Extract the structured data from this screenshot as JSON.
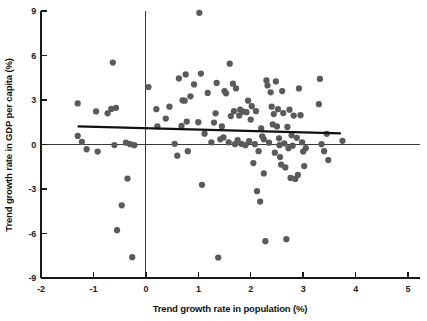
{
  "chart_data": {
    "type": "scatter",
    "title": "",
    "xlabel": "Trend growth rate in population (%)",
    "ylabel": "Trend growth rate in GDP per capita (%)",
    "xlim": [
      -2,
      5.3
    ],
    "ylim": [
      -9,
      9
    ],
    "xticks": [
      -2,
      -1,
      0,
      1,
      2,
      3,
      4,
      5
    ],
    "xtick_labels": [
      "-2",
      "-1",
      "0",
      "1",
      "2",
      "3",
      "4",
      "5"
    ],
    "yticks": [
      -9,
      -6,
      -3,
      0,
      3,
      6,
      9
    ],
    "ytick_labels": [
      "-9",
      "-6",
      "-3",
      "0",
      "3",
      "6",
      "9"
    ],
    "grid": false,
    "legend": "none",
    "marker": {
      "shape": "circle",
      "color": "#5a5a5a",
      "size": 4.0
    },
    "reference_lines": [
      {
        "name": "horizontal-zero-line",
        "orientation": "horizontal",
        "value": 0,
        "color": "#3a3a3a"
      },
      {
        "name": "vertical-zero-line",
        "orientation": "vertical",
        "value": 0,
        "color": "#3a3a3a"
      }
    ],
    "fit_line": {
      "name": "regression-line",
      "x_start": -1.3,
      "y_start": 1.22,
      "x_end": 3.72,
      "y_end": 0.75,
      "color": "#111111"
    },
    "points": [
      [
        -1.3,
        2.77
      ],
      [
        -1.3,
        0.58
      ],
      [
        -1.22,
        0.18
      ],
      [
        -1.13,
        -0.32
      ],
      [
        -0.95,
        2.23
      ],
      [
        -0.92,
        -0.48
      ],
      [
        -0.73,
        2.1
      ],
      [
        -0.66,
        2.4
      ],
      [
        -0.63,
        5.52
      ],
      [
        -0.6,
        -0.04
      ],
      [
        -0.57,
        2.47
      ],
      [
        -0.55,
        -5.78
      ],
      [
        -0.46,
        -4.1
      ],
      [
        -0.38,
        0.12
      ],
      [
        -0.35,
        -2.3
      ],
      [
        -0.3,
        0.02
      ],
      [
        -0.26,
        -7.6
      ],
      [
        -0.22,
        -0.05
      ],
      [
        0.05,
        3.87
      ],
      [
        0.2,
        2.38
      ],
      [
        0.22,
        1.22
      ],
      [
        0.38,
        1.75
      ],
      [
        0.45,
        2.55
      ],
      [
        0.6,
        -0.75
      ],
      [
        0.63,
        4.45
      ],
      [
        0.68,
        1.25
      ],
      [
        0.7,
        2.98
      ],
      [
        0.74,
        2.95
      ],
      [
        0.76,
        4.72
      ],
      [
        0.78,
        1.55
      ],
      [
        0.8,
        -0.45
      ],
      [
        0.85,
        3.25
      ],
      [
        0.92,
        4.05
      ],
      [
        1.0,
        1.5
      ],
      [
        1.02,
        8.88
      ],
      [
        1.05,
        4.78
      ],
      [
        1.07,
        -2.72
      ],
      [
        1.12,
        0.73
      ],
      [
        1.18,
        3.48
      ],
      [
        1.25,
        0.15
      ],
      [
        1.3,
        1.48
      ],
      [
        1.33,
        2.1
      ],
      [
        1.35,
        4.15
      ],
      [
        1.38,
        -7.62
      ],
      [
        1.42,
        0.35
      ],
      [
        1.45,
        1.22
      ],
      [
        1.5,
        3.6
      ],
      [
        1.53,
        3.45
      ],
      [
        1.58,
        0.15
      ],
      [
        1.6,
        5.45
      ],
      [
        1.62,
        1.92
      ],
      [
        1.66,
        4.1
      ],
      [
        1.68,
        2.25
      ],
      [
        1.7,
        0.02
      ],
      [
        1.72,
        3.78
      ],
      [
        1.75,
        0.3
      ],
      [
        1.78,
        1.95
      ],
      [
        1.8,
        2.35
      ],
      [
        1.82,
        0.05
      ],
      [
        1.86,
        2.22
      ],
      [
        1.9,
        -0.05
      ],
      [
        1.92,
        2.18
      ],
      [
        1.95,
        2.95
      ],
      [
        1.97,
        0.22
      ],
      [
        2.0,
        1.68
      ],
      [
        2.02,
        2.58
      ],
      [
        2.05,
        -1.25
      ],
      [
        2.08,
        0.02
      ],
      [
        2.1,
        2.25
      ],
      [
        2.12,
        -3.15
      ],
      [
        2.15,
        -0.45
      ],
      [
        2.18,
        -3.85
      ],
      [
        2.2,
        1.08
      ],
      [
        2.22,
        0.55
      ],
      [
        2.25,
        -1.95
      ],
      [
        2.28,
        -6.52
      ],
      [
        2.3,
        4.32
      ],
      [
        2.32,
        3.98
      ],
      [
        2.35,
        0.12
      ],
      [
        2.38,
        3.52
      ],
      [
        2.4,
        2.55
      ],
      [
        2.42,
        1.35
      ],
      [
        2.44,
        2.05
      ],
      [
        2.46,
        -0.55
      ],
      [
        2.48,
        4.25
      ],
      [
        2.5,
        1.22
      ],
      [
        2.52,
        2.38
      ],
      [
        2.54,
        0.42
      ],
      [
        2.56,
        -0.85
      ],
      [
        2.58,
        -1.35
      ],
      [
        2.6,
        3.6
      ],
      [
        2.62,
        2.12
      ],
      [
        2.64,
        0.08
      ],
      [
        2.66,
        -1.55
      ],
      [
        2.68,
        -6.38
      ],
      [
        2.7,
        1.18
      ],
      [
        2.72,
        -0.25
      ],
      [
        2.74,
        2.35
      ],
      [
        2.76,
        -2.25
      ],
      [
        2.78,
        0.62
      ],
      [
        2.8,
        -0.08
      ],
      [
        2.82,
        1.95
      ],
      [
        2.85,
        -2.32
      ],
      [
        2.88,
        0.45
      ],
      [
        2.9,
        -2.05
      ],
      [
        2.92,
        3.78
      ],
      [
        2.95,
        1.98
      ],
      [
        2.98,
        0.15
      ],
      [
        3.0,
        -0.48
      ],
      [
        3.02,
        -1.45
      ],
      [
        3.05,
        -0.25
      ],
      [
        3.3,
        2.72
      ],
      [
        3.32,
        4.42
      ],
      [
        3.35,
        0.02
      ],
      [
        3.4,
        -0.45
      ],
      [
        3.45,
        0.72
      ],
      [
        3.48,
        -1.05
      ],
      [
        3.75,
        0.25
      ],
      [
        2.25,
        0.35
      ],
      [
        2.55,
        -0.05
      ],
      [
        1.48,
        0.48
      ],
      [
        0.55,
        0.05
      ]
    ]
  },
  "axis_titles": {
    "x": "Trend growth rate in population (%)",
    "y": "Trend growth rate in GDP per capita (%)"
  }
}
